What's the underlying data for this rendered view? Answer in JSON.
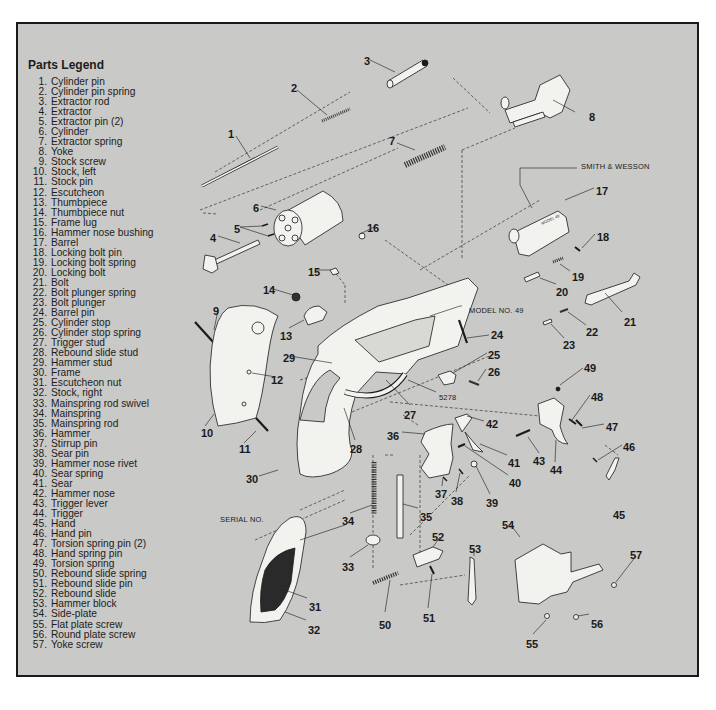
{
  "legend": {
    "title": "Parts Legend",
    "items": [
      {
        "num": "1.",
        "label": "Cylinder pin"
      },
      {
        "num": "2.",
        "label": "Cylinder pin spring"
      },
      {
        "num": "3.",
        "label": "Extractor rod"
      },
      {
        "num": "4.",
        "label": "Extractor"
      },
      {
        "num": "5.",
        "label": "Extractor pin (2)"
      },
      {
        "num": "6.",
        "label": "Cylinder"
      },
      {
        "num": "7.",
        "label": "Extractor spring"
      },
      {
        "num": "8.",
        "label": "Yoke"
      },
      {
        "num": "9.",
        "label": "Stock screw"
      },
      {
        "num": "10.",
        "label": "Stock, left"
      },
      {
        "num": "11.",
        "label": "Stock pin"
      },
      {
        "num": "12.",
        "label": "Escutcheon"
      },
      {
        "num": "13.",
        "label": "Thumbpiece"
      },
      {
        "num": "14.",
        "label": "Thumbpiece nut"
      },
      {
        "num": "15.",
        "label": "Frame lug"
      },
      {
        "num": "16.",
        "label": "Hammer nose bushing"
      },
      {
        "num": "17.",
        "label": "Barrel"
      },
      {
        "num": "18.",
        "label": "Locking bolt pin"
      },
      {
        "num": "19.",
        "label": "Locking bolt spring"
      },
      {
        "num": "20.",
        "label": "Locking bolt"
      },
      {
        "num": "21.",
        "label": "Bolt"
      },
      {
        "num": "22.",
        "label": "Bolt plunger spring"
      },
      {
        "num": "23.",
        "label": "Bolt plunger"
      },
      {
        "num": "24.",
        "label": "Barrel pin"
      },
      {
        "num": "25.",
        "label": "Cylinder stop"
      },
      {
        "num": "26.",
        "label": "Cylinder stop spring"
      },
      {
        "num": "27.",
        "label": "Trigger stud"
      },
      {
        "num": "28.",
        "label": "Rebound slide stud"
      },
      {
        "num": "29.",
        "label": "Hammer stud"
      },
      {
        "num": "30.",
        "label": "Frame"
      },
      {
        "num": "31.",
        "label": "Escutcheon nut"
      },
      {
        "num": "32.",
        "label": "Stock, right"
      },
      {
        "num": "33.",
        "label": "Mainspring rod swivel"
      },
      {
        "num": "34.",
        "label": "Mainspring"
      },
      {
        "num": "35.",
        "label": "Mainspring rod"
      },
      {
        "num": "36.",
        "label": "Hammer"
      },
      {
        "num": "37.",
        "label": "Stirrup pin"
      },
      {
        "num": "38.",
        "label": "Sear pin"
      },
      {
        "num": "39.",
        "label": "Hammer nose rivet"
      },
      {
        "num": "40.",
        "label": "Sear spring"
      },
      {
        "num": "41.",
        "label": "Sear"
      },
      {
        "num": "42.",
        "label": "Hammer nose"
      },
      {
        "num": "43.",
        "label": "Trigger lever"
      },
      {
        "num": "44.",
        "label": "Trigger"
      },
      {
        "num": "45.",
        "label": "Hand"
      },
      {
        "num": "46.",
        "label": "Hand pin"
      },
      {
        "num": "47.",
        "label": "Torsion spring pin (2)"
      },
      {
        "num": "48.",
        "label": "Hand spring pin"
      },
      {
        "num": "49.",
        "label": "Torsion spring"
      },
      {
        "num": "50.",
        "label": "Rebound slide spring"
      },
      {
        "num": "51.",
        "label": "Rebound slide pin"
      },
      {
        "num": "52.",
        "label": "Rebound slide"
      },
      {
        "num": "53.",
        "label": "Hammer block"
      },
      {
        "num": "54.",
        "label": "Side-plate"
      },
      {
        "num": "55.",
        "label": "Flat plate screw"
      },
      {
        "num": "56.",
        "label": "Round plate screw"
      },
      {
        "num": "57.",
        "label": "Yoke screw"
      }
    ]
  },
  "annotations": {
    "brand": "SMITH & WESSON",
    "model": "MODEL NO. 49",
    "serial": "SERIAL NO.",
    "frame_number": "5278"
  },
  "callouts": [
    {
      "n": "1",
      "x": 228,
      "y": 128
    },
    {
      "n": "2",
      "x": 291,
      "y": 82
    },
    {
      "n": "3",
      "x": 364,
      "y": 55
    },
    {
      "n": "4",
      "x": 210,
      "y": 232
    },
    {
      "n": "5",
      "x": 234,
      "y": 223
    },
    {
      "n": "6",
      "x": 253,
      "y": 202
    },
    {
      "n": "7",
      "x": 389,
      "y": 135
    },
    {
      "n": "8",
      "x": 589,
      "y": 111
    },
    {
      "n": "9",
      "x": 213,
      "y": 305
    },
    {
      "n": "10",
      "x": 201,
      "y": 427
    },
    {
      "n": "11",
      "x": 239,
      "y": 443
    },
    {
      "n": "12",
      "x": 271,
      "y": 374
    },
    {
      "n": "13",
      "x": 280,
      "y": 330
    },
    {
      "n": "14",
      "x": 263,
      "y": 284
    },
    {
      "n": "15",
      "x": 308,
      "y": 266
    },
    {
      "n": "16",
      "x": 367,
      "y": 222
    },
    {
      "n": "17",
      "x": 596,
      "y": 185
    },
    {
      "n": "18",
      "x": 597,
      "y": 231
    },
    {
      "n": "19",
      "x": 572,
      "y": 271
    },
    {
      "n": "20",
      "x": 556,
      "y": 286
    },
    {
      "n": "21",
      "x": 624,
      "y": 316
    },
    {
      "n": "22",
      "x": 586,
      "y": 326
    },
    {
      "n": "23",
      "x": 563,
      "y": 339
    },
    {
      "n": "24",
      "x": 491,
      "y": 329
    },
    {
      "n": "25",
      "x": 488,
      "y": 349
    },
    {
      "n": "26",
      "x": 488,
      "y": 366
    },
    {
      "n": "27",
      "x": 404,
      "y": 409
    },
    {
      "n": "28",
      "x": 350,
      "y": 443
    },
    {
      "n": "29",
      "x": 283,
      "y": 352
    },
    {
      "n": "30",
      "x": 246,
      "y": 473
    },
    {
      "n": "31",
      "x": 309,
      "y": 601
    },
    {
      "n": "32",
      "x": 308,
      "y": 624
    },
    {
      "n": "33",
      "x": 342,
      "y": 561
    },
    {
      "n": "34",
      "x": 342,
      "y": 515
    },
    {
      "n": "35",
      "x": 420,
      "y": 511
    },
    {
      "n": "36",
      "x": 387,
      "y": 430
    },
    {
      "n": "37",
      "x": 435,
      "y": 488
    },
    {
      "n": "38",
      "x": 451,
      "y": 495
    },
    {
      "n": "39",
      "x": 486,
      "y": 497
    },
    {
      "n": "40",
      "x": 509,
      "y": 477
    },
    {
      "n": "41",
      "x": 508,
      "y": 457
    },
    {
      "n": "42",
      "x": 486,
      "y": 418
    },
    {
      "n": "43",
      "x": 533,
      "y": 455
    },
    {
      "n": "44",
      "x": 550,
      "y": 464
    },
    {
      "n": "45",
      "x": 613,
      "y": 509
    },
    {
      "n": "46",
      "x": 623,
      "y": 441
    },
    {
      "n": "47",
      "x": 606,
      "y": 421
    },
    {
      "n": "48",
      "x": 591,
      "y": 391
    },
    {
      "n": "49",
      "x": 584,
      "y": 362
    },
    {
      "n": "50",
      "x": 379,
      "y": 619
    },
    {
      "n": "51",
      "x": 423,
      "y": 612
    },
    {
      "n": "52",
      "x": 432,
      "y": 531
    },
    {
      "n": "53",
      "x": 469,
      "y": 543
    },
    {
      "n": "54",
      "x": 502,
      "y": 519
    },
    {
      "n": "55",
      "x": 526,
      "y": 638
    },
    {
      "n": "56",
      "x": 591,
      "y": 618
    },
    {
      "n": "57",
      "x": 630,
      "y": 549
    }
  ],
  "colors": {
    "panel_bg": "#c9c9c7",
    "ink": "#1a1a1a",
    "part_fill": "#f2f2ee"
  }
}
